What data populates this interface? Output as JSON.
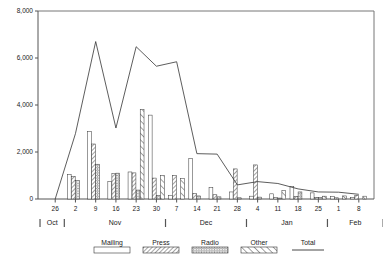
{
  "chart_data": {
    "type": "bar",
    "title": "",
    "subtitle": "",
    "xlabel": "",
    "ylabel": "",
    "ylim": [
      0,
      8000
    ],
    "yticks": [
      0,
      2000,
      4000,
      6000,
      8000
    ],
    "ytick_labels": [
      "0",
      "2,000",
      "4,000",
      "6,000",
      "8,000"
    ],
    "grid": false,
    "legend_position": "bottom",
    "categories": [
      "26",
      "2",
      "9",
      "16",
      "23",
      "30",
      "7",
      "14",
      "21",
      "28",
      "4",
      "11",
      "18",
      "25",
      "1",
      "8"
    ],
    "category_axis_note": "weekly dates; month bands below",
    "month_bands": [
      {
        "label": "Oct",
        "start_category": "26",
        "end_category": "26"
      },
      {
        "label": "Nov",
        "start_category": "2",
        "end_category": "30"
      },
      {
        "label": "Dec",
        "start_category": "7",
        "end_category": "28"
      },
      {
        "label": "Jan",
        "start_category": "4",
        "end_category": "25"
      },
      {
        "label": "Feb",
        "start_category": "1",
        "end_category": "8"
      }
    ],
    "series": [
      {
        "name": "Mailing",
        "pattern": "solid-white",
        "values": [
          0,
          1050,
          2880,
          740,
          1150,
          3570,
          160,
          1730,
          480,
          300,
          120,
          220,
          530,
          260,
          100,
          70
        ]
      },
      {
        "name": "Press",
        "pattern": "diagonal-hatch",
        "values": [
          0,
          960,
          2340,
          1080,
          1110,
          890,
          1000,
          240,
          180,
          1280,
          1450,
          60,
          110,
          70,
          50,
          160
        ]
      },
      {
        "name": "Radio",
        "pattern": "dotted-grid",
        "values": [
          0,
          780,
          1480,
          1100,
          380,
          150,
          0,
          130,
          90,
          50,
          80,
          40,
          300,
          60,
          0,
          0
        ]
      },
      {
        "name": "Other",
        "pattern": "wide-diagonal",
        "values": [
          0,
          0,
          0,
          0,
          3800,
          990,
          870,
          0,
          0,
          0,
          0,
          360,
          0,
          120,
          130,
          120
        ]
      }
    ],
    "overlay_series": {
      "name": "Total",
      "style": "line",
      "values": [
        0,
        2780,
        6700,
        3020,
        6480,
        5650,
        5840,
        1930,
        1910,
        600,
        740,
        660,
        430,
        300,
        290,
        200
      ]
    },
    "legend": [
      {
        "label": "Mailing",
        "pattern": "solid-white"
      },
      {
        "label": "Press",
        "pattern": "diagonal-hatch"
      },
      {
        "label": "Radio",
        "pattern": "dotted-grid"
      },
      {
        "label": "Other",
        "pattern": "wide-diagonal"
      },
      {
        "label": "Total",
        "pattern": "line"
      }
    ]
  }
}
